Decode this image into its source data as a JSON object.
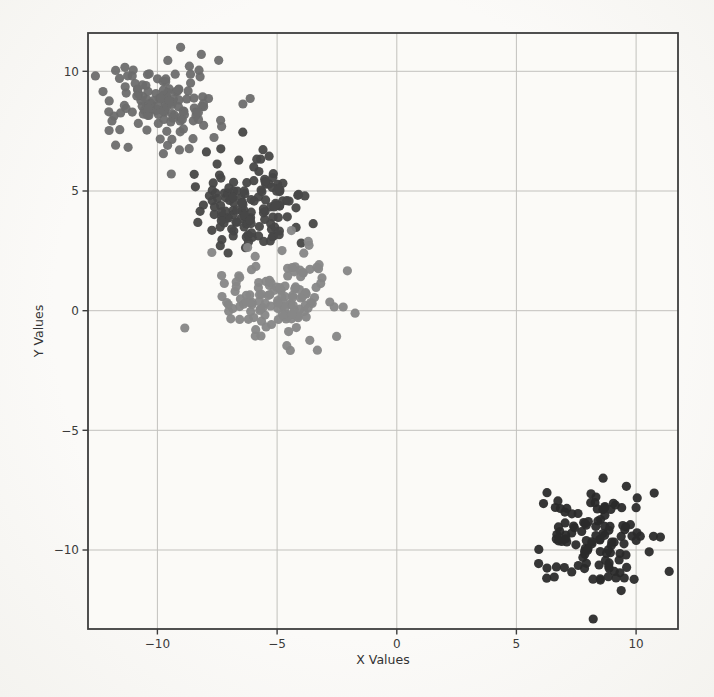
{
  "figure": {
    "background": "#f8f7f4",
    "plot_background": "#fbfaf7"
  },
  "chart_data": {
    "type": "scatter",
    "title": "",
    "xlabel": "X Values",
    "ylabel": "Y Values",
    "xlim": [
      -12.9,
      11.75
    ],
    "ylim": [
      -13.3,
      11.6
    ],
    "xticks": [
      -10,
      -5,
      0,
      5,
      10
    ],
    "yticks": [
      -10,
      -5,
      0,
      5,
      10
    ],
    "grid": true,
    "grid_color": "#c2c1bd",
    "axis_color": "#3d3d3d",
    "tick_label_color": "#3a3a3a",
    "marker_radius": 4.6,
    "marker_opacity": 0.95,
    "legend": "none",
    "series": [
      {
        "name": "cluster-top-left",
        "color": "#6d6d6d",
        "center": [
          -9.6,
          8.7
        ],
        "std": [
          1.15,
          0.95
        ],
        "count": 140
      },
      {
        "name": "cluster-middle",
        "color": "#474747",
        "center": [
          -6.2,
          4.4
        ],
        "std": [
          1.05,
          0.95
        ],
        "count": 140
      },
      {
        "name": "cluster-lower-middle",
        "color": "#878787",
        "center": [
          -4.9,
          0.6
        ],
        "std": [
          1.1,
          1.0
        ],
        "count": 135
      },
      {
        "name": "cluster-bottom-right",
        "color": "#2b2b2b",
        "center": [
          8.1,
          -9.4
        ],
        "std": [
          1.1,
          1.1
        ],
        "count": 120
      }
    ]
  }
}
